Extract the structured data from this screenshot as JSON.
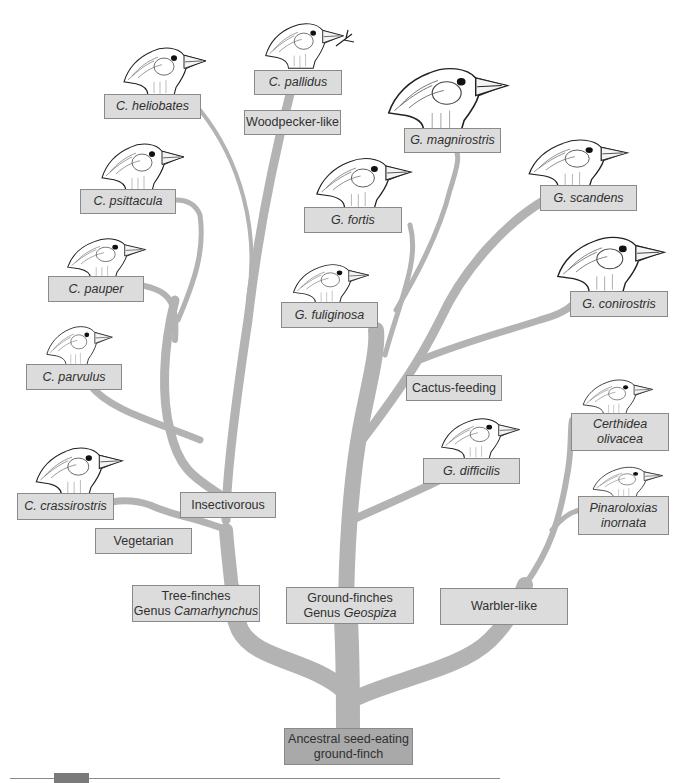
{
  "diagram": {
    "type": "phylogenetic-tree",
    "branch_color": "#b3b3b3",
    "label_fill": "#dcdcdc",
    "root_fill": "#a9a9a9",
    "root": {
      "line1": "Ancestral seed-eating",
      "line2": "ground-finch"
    },
    "groups": {
      "tree_finches": {
        "line1": "Tree-finches",
        "line2_prefix": "Genus ",
        "line2_italic": "Camarhynchus"
      },
      "ground_finches": {
        "line1": "Ground-finches",
        "line2_prefix": "Genus ",
        "line2_italic": "Geospiza"
      },
      "warbler_like": {
        "label": "Warbler-like"
      }
    },
    "diets": {
      "woodpecker_like": "Woodpecker-like",
      "insectivorous": "Insectivorous",
      "vegetarian": "Vegetarian",
      "cactus_feeding": "Cactus-feeding"
    },
    "species": {
      "c_heliobates": "C. heliobates",
      "c_pallidus": "C. pallidus",
      "c_psittacula": "C. psittacula",
      "c_pauper": "C. pauper",
      "c_parvulus": "C. parvulus",
      "c_crassirostris": "C. crassirostris",
      "g_magnirostris": "G. magnirostris",
      "g_fortis": "G. fortis",
      "g_scandens": "G. scandens",
      "g_fuliginosa": "G. fuliginosa",
      "g_conirostris": "G. conirostris",
      "g_difficilis": "G. difficilis",
      "certhidea_line1": "Certhidea",
      "certhidea_line2": "olivacea",
      "pinaroloxias_line1": "Pinaroloxias",
      "pinaroloxias_line2": "inornata"
    },
    "icons": {
      "bird": "finch-head-icon",
      "twig": "twig-tool-icon"
    }
  }
}
